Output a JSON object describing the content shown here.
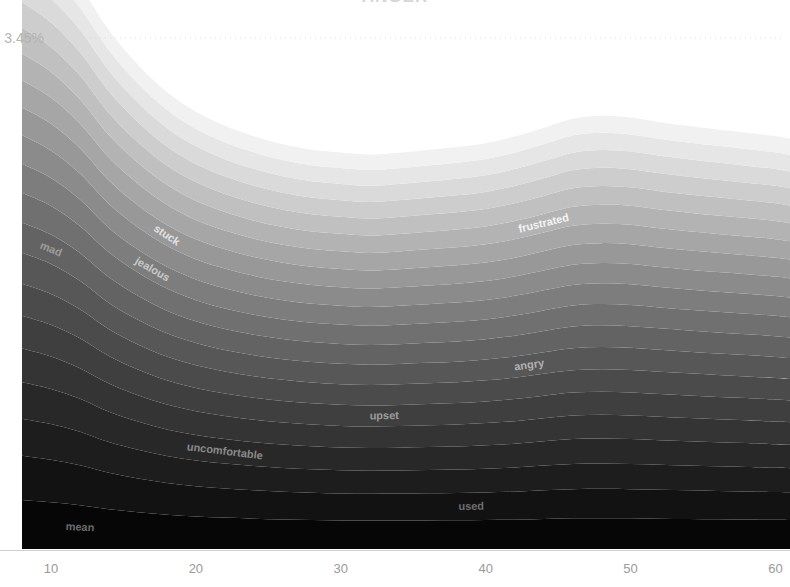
{
  "chart": {
    "title": "ANGER",
    "type": "streamgraph"
  },
  "axes": {
    "y_gridline_label": "3.45%",
    "y_gridline_value": 3.45,
    "x_ticks": [
      "10",
      "20",
      "30",
      "40",
      "50",
      "60"
    ],
    "x_tick_values": [
      10,
      20,
      30,
      40,
      50,
      60
    ],
    "xlim": [
      8,
      61
    ],
    "ylim": [
      0,
      3.45
    ]
  },
  "colors": {
    "background": "#ffffff",
    "gridline": "#dcdcdc",
    "tick_label": "#9a9a9a",
    "y_label": "#b4b4b4",
    "title": "#d6d6d6",
    "light_band": "#f2f2f2",
    "dark_band": "#050505"
  },
  "chart_data": {
    "type": "area",
    "title": "ANGER",
    "subtitle": "",
    "xlabel": "",
    "ylabel": "3.45%",
    "xlim": [
      8,
      61
    ],
    "ylim": [
      0,
      3.45
    ],
    "grid": true,
    "legend": "inline-labels",
    "stacking": "zero",
    "x": [
      8,
      10,
      12,
      14,
      16,
      18,
      20,
      22,
      24,
      26,
      28,
      30,
      32,
      34,
      36,
      38,
      40,
      42,
      44,
      46,
      48,
      50,
      52,
      54,
      56,
      58,
      60,
      61
    ],
    "series": [
      {
        "name": "mean",
        "label": "mean",
        "label_color": "#6a6a6a",
        "color": "#060606",
        "label_x": 12,
        "label_point_index": 2,
        "values": [
          0.33,
          0.315,
          0.295,
          0.268,
          0.248,
          0.232,
          0.22,
          0.212,
          0.205,
          0.2,
          0.196,
          0.193,
          0.192,
          0.192,
          0.193,
          0.194,
          0.196,
          0.198,
          0.203,
          0.207,
          0.208,
          0.207,
          0.205,
          0.203,
          0.201,
          0.199,
          0.197,
          0.196
        ]
      },
      {
        "name": "used",
        "label": "used",
        "label_color": "#6e6e6e",
        "color": "#121212",
        "label_x": 39,
        "label_point_index": 16,
        "values": [
          0.3,
          0.288,
          0.27,
          0.246,
          0.228,
          0.214,
          0.204,
          0.197,
          0.191,
          0.187,
          0.184,
          0.182,
          0.181,
          0.182,
          0.183,
          0.184,
          0.186,
          0.189,
          0.193,
          0.197,
          0.198,
          0.197,
          0.195,
          0.193,
          0.191,
          0.19,
          0.188,
          0.187
        ]
      },
      {
        "name": "hostile",
        "label": "",
        "label_color": "#777777",
        "color": "#1d1d1d",
        "label_x": null,
        "label_point_index": null,
        "values": [
          0.25,
          0.241,
          0.227,
          0.208,
          0.194,
          0.182,
          0.174,
          0.168,
          0.164,
          0.16,
          0.158,
          0.156,
          0.156,
          0.156,
          0.157,
          0.158,
          0.16,
          0.163,
          0.167,
          0.17,
          0.171,
          0.17,
          0.169,
          0.167,
          0.166,
          0.164,
          0.163,
          0.162
        ]
      },
      {
        "name": "uncomfortable",
        "label": "uncomfortable",
        "label_color": "#8a8a8a",
        "color": "#282828",
        "label_x": 22,
        "label_point_index": 7,
        "values": [
          0.245,
          0.236,
          0.222,
          0.204,
          0.19,
          0.179,
          0.171,
          0.165,
          0.161,
          0.158,
          0.155,
          0.154,
          0.153,
          0.154,
          0.155,
          0.156,
          0.158,
          0.161,
          0.164,
          0.168,
          0.169,
          0.168,
          0.166,
          0.165,
          0.163,
          0.162,
          0.16,
          0.159
        ]
      },
      {
        "name": "bitter",
        "label": "",
        "label_color": "#939393",
        "color": "#343434",
        "label_x": null,
        "label_point_index": null,
        "values": [
          0.228,
          0.22,
          0.207,
          0.191,
          0.178,
          0.168,
          0.161,
          0.156,
          0.152,
          0.149,
          0.147,
          0.146,
          0.145,
          0.146,
          0.147,
          0.148,
          0.15,
          0.152,
          0.156,
          0.159,
          0.16,
          0.159,
          0.158,
          0.156,
          0.155,
          0.154,
          0.152,
          0.151
        ]
      },
      {
        "name": "upset",
        "label": "upset",
        "label_color": "#9c9c9c",
        "color": "#3f3f3f",
        "label_x": 33,
        "label_point_index": 13,
        "values": [
          0.222,
          0.214,
          0.202,
          0.186,
          0.174,
          0.164,
          0.157,
          0.152,
          0.148,
          0.146,
          0.144,
          0.143,
          0.142,
          0.143,
          0.144,
          0.145,
          0.146,
          0.149,
          0.152,
          0.155,
          0.156,
          0.156,
          0.154,
          0.153,
          0.151,
          0.15,
          0.149,
          0.148
        ]
      },
      {
        "name": "annoyed",
        "label": "",
        "label_color": "#a5a5a5",
        "color": "#4b4b4b",
        "label_x": null,
        "label_point_index": null,
        "values": [
          0.215,
          0.208,
          0.196,
          0.181,
          0.169,
          0.16,
          0.153,
          0.148,
          0.145,
          0.142,
          0.14,
          0.139,
          0.139,
          0.139,
          0.14,
          0.141,
          0.143,
          0.145,
          0.148,
          0.151,
          0.152,
          0.152,
          0.15,
          0.149,
          0.148,
          0.146,
          0.145,
          0.144
        ]
      },
      {
        "name": "angry",
        "label": "angry",
        "label_color": "#b2b2b2",
        "color": "#575757",
        "label_x": 43,
        "label_point_index": 18,
        "values": [
          0.21,
          0.203,
          0.192,
          0.177,
          0.166,
          0.157,
          0.15,
          0.145,
          0.142,
          0.139,
          0.138,
          0.137,
          0.136,
          0.137,
          0.138,
          0.139,
          0.14,
          0.143,
          0.146,
          0.149,
          0.15,
          0.149,
          0.148,
          0.146,
          0.145,
          0.144,
          0.143,
          0.142
        ]
      },
      {
        "name": "mad",
        "label": "mad",
        "label_color": "#9d9d9d",
        "color": "#636363",
        "label_x": 10,
        "label_point_index": 1,
        "values": [
          0.205,
          0.198,
          0.187,
          0.173,
          0.162,
          0.153,
          0.147,
          0.142,
          0.139,
          0.136,
          0.135,
          0.134,
          0.133,
          0.134,
          0.135,
          0.136,
          0.137,
          0.14,
          0.143,
          0.146,
          0.147,
          0.146,
          0.145,
          0.143,
          0.142,
          0.141,
          0.14,
          0.139
        ]
      },
      {
        "name": "irritated",
        "label": "",
        "label_color": "#c2c2c2",
        "color": "#707070",
        "label_x": null,
        "label_point_index": null,
        "values": [
          0.2,
          0.193,
          0.183,
          0.169,
          0.158,
          0.15,
          0.143,
          0.139,
          0.135,
          0.133,
          0.131,
          0.131,
          0.13,
          0.131,
          0.132,
          0.133,
          0.134,
          0.136,
          0.139,
          0.142,
          0.143,
          0.143,
          0.141,
          0.14,
          0.139,
          0.138,
          0.137,
          0.136
        ]
      },
      {
        "name": "jealous",
        "label": "jealous",
        "label_color": "#c9c9c9",
        "color": "#7d7d7d",
        "label_x": 17,
        "label_point_index": 5,
        "values": [
          0.196,
          0.189,
          0.179,
          0.165,
          0.155,
          0.146,
          0.14,
          0.136,
          0.132,
          0.13,
          0.128,
          0.128,
          0.127,
          0.128,
          0.129,
          0.13,
          0.131,
          0.133,
          0.136,
          0.139,
          0.14,
          0.14,
          0.138,
          0.137,
          0.136,
          0.135,
          0.134,
          0.133
        ]
      },
      {
        "name": "resentful",
        "label": "",
        "label_color": "#d4d4d4",
        "color": "#8b8b8b",
        "label_x": null,
        "label_point_index": null,
        "values": [
          0.192,
          0.185,
          0.175,
          0.162,
          0.151,
          0.143,
          0.137,
          0.133,
          0.13,
          0.127,
          0.126,
          0.125,
          0.124,
          0.125,
          0.126,
          0.127,
          0.128,
          0.13,
          0.133,
          0.136,
          0.137,
          0.137,
          0.135,
          0.134,
          0.133,
          0.132,
          0.131,
          0.13
        ]
      },
      {
        "name": "stuck",
        "label": "stuck",
        "label_color": "#e2e2e2",
        "color": "#989898",
        "label_x": 18,
        "label_point_index": 5,
        "values": [
          0.188,
          0.181,
          0.171,
          0.158,
          0.148,
          0.14,
          0.134,
          0.13,
          0.127,
          0.125,
          0.123,
          0.122,
          0.122,
          0.122,
          0.123,
          0.124,
          0.125,
          0.127,
          0.13,
          0.133,
          0.134,
          0.134,
          0.132,
          0.131,
          0.13,
          0.129,
          0.128,
          0.127
        ]
      },
      {
        "name": "furious",
        "label": "",
        "label_color": "#e9e9e9",
        "color": "#a6a6a6",
        "label_x": null,
        "label_point_index": null,
        "values": [
          0.184,
          0.177,
          0.167,
          0.155,
          0.145,
          0.137,
          0.131,
          0.127,
          0.124,
          0.122,
          0.121,
          0.12,
          0.119,
          0.12,
          0.121,
          0.122,
          0.123,
          0.125,
          0.127,
          0.13,
          0.131,
          0.131,
          0.129,
          0.128,
          0.127,
          0.126,
          0.125,
          0.124
        ]
      },
      {
        "name": "frustrated",
        "label": "frustrated",
        "label_color": "#f4f4f4",
        "color": "#b3b3b3",
        "label_x": 44,
        "label_point_index": 18,
        "values": [
          0.18,
          0.173,
          0.164,
          0.152,
          0.142,
          0.134,
          0.129,
          0.125,
          0.122,
          0.12,
          0.118,
          0.118,
          0.117,
          0.118,
          0.119,
          0.12,
          0.121,
          0.123,
          0.125,
          0.128,
          0.129,
          0.128,
          0.127,
          0.126,
          0.125,
          0.124,
          0.123,
          0.122
        ]
      },
      {
        "name": "offended",
        "label": "",
        "label_color": "#ffffff",
        "color": "#c0c0c0",
        "label_x": null,
        "label_point_index": null,
        "values": [
          0.176,
          0.169,
          0.16,
          0.148,
          0.139,
          0.131,
          0.126,
          0.122,
          0.119,
          0.117,
          0.116,
          0.115,
          0.115,
          0.115,
          0.116,
          0.117,
          0.118,
          0.12,
          0.122,
          0.125,
          0.126,
          0.125,
          0.124,
          0.123,
          0.122,
          0.121,
          0.12,
          0.119
        ]
      },
      {
        "name": "enraged",
        "label": "",
        "label_color": "#ffffff",
        "color": "#cdcdcd",
        "label_x": null,
        "label_point_index": null,
        "values": [
          0.172,
          0.165,
          0.156,
          0.145,
          0.136,
          0.128,
          0.123,
          0.119,
          0.117,
          0.114,
          0.113,
          0.112,
          0.112,
          0.112,
          0.113,
          0.114,
          0.115,
          0.117,
          0.119,
          0.122,
          0.123,
          0.122,
          0.121,
          0.12,
          0.119,
          0.118,
          0.117,
          0.116
        ]
      },
      {
        "name": "grumpy",
        "label": "",
        "label_color": "#ffffff",
        "color": "#dadada",
        "label_x": null,
        "label_point_index": null,
        "values": [
          0.168,
          0.161,
          0.152,
          0.141,
          0.132,
          0.125,
          0.12,
          0.116,
          0.114,
          0.112,
          0.11,
          0.11,
          0.109,
          0.11,
          0.11,
          0.111,
          0.112,
          0.114,
          0.116,
          0.119,
          0.12,
          0.119,
          0.118,
          0.117,
          0.116,
          0.115,
          0.114,
          0.114
        ]
      },
      {
        "name": "outraged",
        "label": "",
        "label_color": "#ffffff",
        "color": "#e6e6e6",
        "label_x": null,
        "label_point_index": null,
        "values": [
          0.164,
          0.157,
          0.149,
          0.138,
          0.129,
          0.122,
          0.117,
          0.114,
          0.111,
          0.109,
          0.108,
          0.107,
          0.107,
          0.107,
          0.108,
          0.109,
          0.11,
          0.111,
          0.113,
          0.116,
          0.117,
          0.116,
          0.115,
          0.114,
          0.113,
          0.113,
          0.112,
          0.111
        ]
      },
      {
        "name": "cranky",
        "label": "",
        "label_color": "#ffffff",
        "color": "#f1f1f1",
        "label_x": null,
        "label_point_index": null,
        "values": [
          0.16,
          0.154,
          0.145,
          0.135,
          0.126,
          0.12,
          0.115,
          0.111,
          0.109,
          0.107,
          0.105,
          0.105,
          0.104,
          0.105,
          0.105,
          0.106,
          0.107,
          0.109,
          0.111,
          0.113,
          0.114,
          0.114,
          0.112,
          0.111,
          0.111,
          0.11,
          0.109,
          0.109
        ]
      }
    ]
  }
}
